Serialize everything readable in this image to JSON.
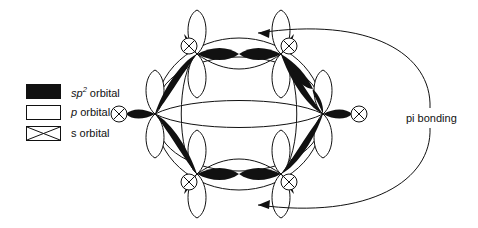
{
  "figure": {
    "background_color": "#ffffff",
    "stroke_color": "#111111",
    "fill_color": "#111111"
  },
  "legend": {
    "items": [
      {
        "swatch": "filled-black-rectangle",
        "symbol": "sp",
        "superscript": "2",
        "label_suffix": " orbital",
        "full_label": "sp2 orbital"
      },
      {
        "swatch": "empty-rectangle",
        "symbol": "p",
        "superscript": "",
        "label_suffix": " orbital",
        "full_label": "p orbital"
      },
      {
        "swatch": "crossed-rectangle",
        "symbol": "s",
        "superscript": "",
        "label_suffix": " orbital",
        "full_label": "s orbital"
      }
    ]
  },
  "annotations": {
    "pi_bonding_label": "pi bonding"
  },
  "molecule": {
    "name": "benzene",
    "atom_count": 6,
    "atoms": [
      {
        "id": "c1",
        "x": 197,
        "y": 54,
        "label": "carbon-upper-left"
      },
      {
        "id": "c2",
        "x": 281,
        "y": 54,
        "label": "carbon-upper-right"
      },
      {
        "id": "c3",
        "x": 323,
        "y": 114,
        "label": "carbon-right"
      },
      {
        "id": "c4",
        "x": 281,
        "y": 174,
        "label": "carbon-lower-right"
      },
      {
        "id": "c5",
        "x": 197,
        "y": 174,
        "label": "carbon-lower-left"
      },
      {
        "id": "c6",
        "x": 155,
        "y": 114,
        "label": "carbon-left"
      }
    ],
    "hydrogens": [
      {
        "id": "h1",
        "x": 189,
        "y": 46,
        "r": 8,
        "label": "s-orbital-upper-left"
      },
      {
        "id": "h2",
        "x": 289,
        "y": 46,
        "r": 8,
        "label": "s-orbital-upper-right"
      },
      {
        "id": "h3",
        "x": 358,
        "y": 114,
        "r": 8,
        "label": "s-orbital-right"
      },
      {
        "id": "h4",
        "x": 289,
        "y": 182,
        "r": 8,
        "label": "s-orbital-lower-right"
      },
      {
        "id": "h5",
        "x": 189,
        "y": 182,
        "r": 8,
        "label": "s-orbital-lower-left"
      },
      {
        "id": "h6",
        "x": 120,
        "y": 114,
        "r": 8,
        "label": "s-orbital-left"
      }
    ]
  }
}
